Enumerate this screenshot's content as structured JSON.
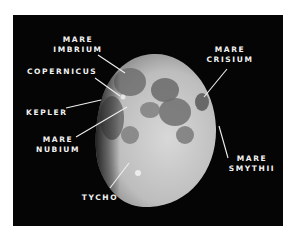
{
  "diagram": {
    "phase": "waxing gibbous",
    "background_color": "#050505",
    "label_color": "#f2f2f2",
    "labels": [
      {
        "id": "mare-imbrium",
        "line1": "MARE",
        "line2": "IMBRIUM"
      },
      {
        "id": "copernicus",
        "line1": "COPERNICUS",
        "line2": ""
      },
      {
        "id": "kepler",
        "line1": "KEPLER",
        "line2": ""
      },
      {
        "id": "mare-nubium",
        "line1": "MARE",
        "line2": "NUBIUM"
      },
      {
        "id": "tycho",
        "line1": "TYCHO",
        "line2": ""
      },
      {
        "id": "mare-crisium",
        "line1": "MARE",
        "line2": "CRISIUM"
      },
      {
        "id": "mare-smythii",
        "line1": "MARE",
        "line2": "SMYTHII"
      }
    ]
  }
}
